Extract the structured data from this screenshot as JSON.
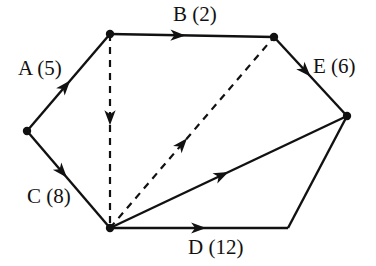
{
  "diagram": {
    "type": "directed-graph",
    "background_color": "#ffffff",
    "stroke_color": "#111111",
    "nodes": [
      {
        "id": "n-left",
        "name": "node-left",
        "x": 27,
        "y": 131,
        "visible_dot": true
      },
      {
        "id": "n-top-left",
        "name": "node-top-left",
        "x": 110,
        "y": 34,
        "visible_dot": true
      },
      {
        "id": "n-top-right",
        "name": "node-top-right",
        "x": 274,
        "y": 37,
        "visible_dot": true
      },
      {
        "id": "n-right",
        "name": "node-right",
        "x": 347,
        "y": 116,
        "visible_dot": true
      },
      {
        "id": "n-bottom-left",
        "name": "node-bottom-left",
        "x": 110,
        "y": 228,
        "visible_dot": true
      },
      {
        "id": "n-bottom-right",
        "name": "node-bottom-right",
        "x": 288,
        "y": 228,
        "visible_dot": false
      }
    ],
    "edges": [
      {
        "id": "edge-a",
        "label": "A (5)",
        "from": "n-left",
        "to": "n-top-left",
        "style": "solid",
        "arrow_t": 0.52
      },
      {
        "id": "edge-b",
        "label": "B (2)",
        "from": "n-top-left",
        "to": "n-top-right",
        "style": "solid",
        "arrow_t": 0.46
      },
      {
        "id": "edge-c",
        "label": "C (8)",
        "from": "n-left",
        "to": "n-bottom-left",
        "style": "solid",
        "arrow_t": 0.48
      },
      {
        "id": "edge-d",
        "label": "D (12)",
        "from": "n-bottom-left",
        "to": "n-bottom-right",
        "style": "solid",
        "arrow_t": 0.54
      },
      {
        "id": "edge-e",
        "label": "E (6)",
        "from": "n-top-right",
        "to": "n-right",
        "style": "solid",
        "arrow_t": 0.5
      },
      {
        "id": "edge-right-bottom",
        "label": "",
        "from": "n-right",
        "to": "n-bottom-right",
        "style": "solid",
        "arrow_t": -1
      },
      {
        "id": "edge-diagonal-solid",
        "label": "",
        "from": "n-bottom-left",
        "to": "n-right",
        "style": "solid",
        "arrow_t": 0.5
      },
      {
        "id": "edge-dashed-vertical",
        "label": "",
        "from": "n-top-left",
        "to": "n-bottom-left",
        "style": "dashed",
        "arrow_t": 0.47
      },
      {
        "id": "edge-dashed-diagonal",
        "label": "",
        "from": "n-bottom-left",
        "to": "n-top-right",
        "style": "dashed",
        "arrow_t": 0.47
      }
    ],
    "labels": [
      {
        "id": "label-a",
        "name": "edge-label-a",
        "text": "A (5)",
        "x": 18,
        "y": 58
      },
      {
        "id": "label-b",
        "name": "edge-label-b",
        "text": "B (2)",
        "x": 173,
        "y": 4
      },
      {
        "id": "label-c",
        "name": "edge-label-c",
        "text": "C (8)",
        "x": 27,
        "y": 186
      },
      {
        "id": "label-d",
        "name": "edge-label-d",
        "text": "D (12)",
        "x": 188,
        "y": 237
      },
      {
        "id": "label-e",
        "name": "edge-label-e",
        "text": "E (6)",
        "x": 313,
        "y": 56
      }
    ]
  },
  "chart_data": {
    "type": "diagram",
    "title": "",
    "nodes": 6,
    "edge_weights": {
      "A": 5,
      "B": 2,
      "C": 8,
      "D": 12,
      "E": 6
    }
  }
}
